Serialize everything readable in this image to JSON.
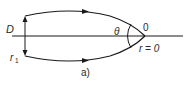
{
  "diagram": {
    "caption": "a)",
    "labels": {
      "D": "D",
      "r1_main": "r",
      "r1_sub": "1",
      "theta": "θ",
      "origin": "0",
      "r_zero": "r = 0"
    },
    "colors": {
      "stroke": "#1a1a1a",
      "text": "#2a2a2a",
      "background": "#ffffff"
    }
  }
}
